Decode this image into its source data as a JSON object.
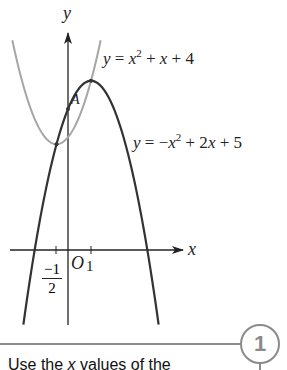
{
  "chart_data": {
    "type": "line",
    "title": "",
    "xlabel": "x",
    "ylabel": "y",
    "origin_label": "O",
    "x_ticks": [
      {
        "value": -0.5,
        "label_num": "−1",
        "label_den": "2"
      },
      {
        "value": 1,
        "label": "1"
      }
    ],
    "grid": false,
    "series": [
      {
        "name": "y = x² + x + 4",
        "equation": "x^2 + x + 4",
        "coeffs": [
          1,
          1,
          4
        ],
        "x_range": [
          -2.42,
          1.42
        ],
        "color": "#a6a6a6",
        "label_parts": {
          "lhs": "y",
          "eq": " = ",
          "a": "x",
          "exp": "2",
          "rest_op1": " + ",
          "rest_var": "x",
          "rest_op2": " + 4"
        }
      },
      {
        "name": "y = −x² + 2x + 5",
        "equation": "-x^2 + 2x + 5",
        "coeffs": [
          -1,
          2,
          5
        ],
        "x_range": [
          -1.94,
          3.94
        ],
        "color": "#333333",
        "label_parts": {
          "lhs": "y",
          "eq": " = −",
          "a": "x",
          "exp": "2",
          "rest_op1": " + 2",
          "rest_var": "x",
          "rest_op2": " + 5"
        }
      }
    ],
    "points": [
      {
        "label": "A",
        "x": 0,
        "y": 5
      },
      {
        "label": "",
        "x": -0.5,
        "y": 3.75
      },
      {
        "label": "",
        "x": 1,
        "y": 6
      }
    ],
    "intersections": [
      [
        -0.5,
        3.75
      ],
      [
        1,
        6
      ]
    ],
    "axis_pixels": {
      "origin_x": 68,
      "origin_y": 250,
      "unit_x": 23,
      "unit_y": 28.2
    }
  },
  "footer": {
    "step_number": "1",
    "hint_text_pre": "Use the ",
    "hint_var": "x",
    "hint_text_post": " values of the"
  }
}
